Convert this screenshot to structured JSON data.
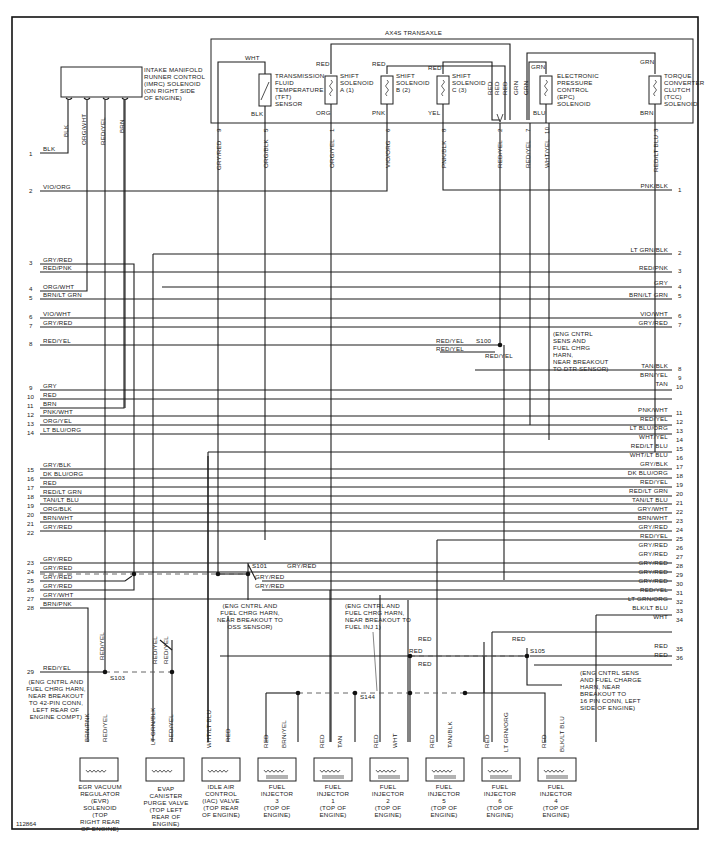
{
  "figure_id": "112864",
  "transaxle": {
    "title": "AX4S TRANSAXLE",
    "components": [
      {
        "id": "tft",
        "label": [
          "TRANSMISSION",
          "FLUID",
          "TEMPERATURE",
          "(TFT)",
          "SENSOR"
        ],
        "top_wire": "WHT",
        "bottom_wire": "BLK"
      },
      {
        "id": "ssa",
        "label": [
          "SHIFT",
          "SOLENOID",
          "A (1)"
        ],
        "top_wire": "RED",
        "bottom_wire": "ORG"
      },
      {
        "id": "ssb",
        "label": [
          "SHIFT",
          "SOLENOID",
          "B (2)"
        ],
        "top_wire": "RED",
        "bottom_wire": "PNK"
      },
      {
        "id": "ssc",
        "label": [
          "SHIFT",
          "SOLENOID",
          "C (3)"
        ],
        "top_wire": "RED",
        "bottom_wire": "YEL"
      },
      {
        "id": "epc",
        "label": [
          "ELECTRONIC",
          "PRESSURE",
          "CONTROL",
          "(EPC)",
          "SOLENOID"
        ],
        "top_wire": "GRN",
        "bottom_wire": "BLU"
      },
      {
        "id": "tcc",
        "label": [
          "TORQUE",
          "CONVERTER",
          "CLUTCH",
          "(TCC)",
          "SOLENOID"
        ],
        "top_wire": "GRN",
        "bottom_wire": "BRN"
      }
    ],
    "merge_labels": [
      "RED",
      "RED",
      "RED",
      "GRN",
      "GRN"
    ],
    "pins": [
      {
        "pin": "9",
        "wire": "GRY/RED"
      },
      {
        "pin": "5",
        "wire": "ORG/BLK"
      },
      {
        "pin": "1",
        "wire": "ORG/YEL"
      },
      {
        "pin": "6",
        "wire": "VIO/ORG"
      },
      {
        "pin": "8",
        "wire": "PNK/BLK"
      },
      {
        "pin": "2",
        "wire": "RED/YEL"
      },
      {
        "pin": "7",
        "wire": "RED/YEL"
      },
      {
        "pin": "10",
        "wire": "WHT/YEL"
      },
      {
        "pin": "3",
        "wire": "RED/LT BLU"
      }
    ]
  },
  "imrc": {
    "label": [
      "INTAKE MANIFOLD",
      "RUNNER CONTROL",
      "(IMRC) SOLENOID",
      "(ON RIGHT SIDE",
      "OF ENGINE)"
    ],
    "wires": [
      "BLK",
      "ORG/WHT",
      "RED/YEL",
      "BRN"
    ]
  },
  "left_connector": [
    {
      "pin": "1",
      "wire": "BLK"
    },
    {
      "pin": "2",
      "wire": "VIO/ORG"
    },
    {
      "pin": "3",
      "wire": "GRY/RED"
    },
    {
      "pin": "",
      "wire": "RED/PNK"
    },
    {
      "pin": "4",
      "wire": "ORG/WHT"
    },
    {
      "pin": "5",
      "wire": "BRN/LT GRN"
    },
    {
      "pin": "6",
      "wire": "VIO/WHT"
    },
    {
      "pin": "7",
      "wire": "GRY/RED"
    },
    {
      "pin": "8",
      "wire": "RED/YEL"
    },
    {
      "pin": "9",
      "wire": "GRY"
    },
    {
      "pin": "10",
      "wire": "RED"
    },
    {
      "pin": "11",
      "wire": "BRN"
    },
    {
      "pin": "12",
      "wire": "PNK/WHT"
    },
    {
      "pin": "13",
      "wire": "ORG/YEL"
    },
    {
      "pin": "14",
      "wire": "LT BLU/ORG"
    },
    {
      "pin": "15",
      "wire": "GRY/BLK"
    },
    {
      "pin": "16",
      "wire": "DK BLU/ORG"
    },
    {
      "pin": "17",
      "wire": "RED"
    },
    {
      "pin": "18",
      "wire": "RED/LT GRN"
    },
    {
      "pin": "19",
      "wire": "TAN/LT BLU"
    },
    {
      "pin": "20",
      "wire": "ORG/BLK"
    },
    {
      "pin": "21",
      "wire": "BRN/WHT"
    },
    {
      "pin": "22",
      "wire": "GRY/RED"
    },
    {
      "pin": "23",
      "wire": "GRY/RED"
    },
    {
      "pin": "24",
      "wire": "GRY/RED"
    },
    {
      "pin": "25",
      "wire": "GRY/RED"
    },
    {
      "pin": "26",
      "wire": "GRY/RED"
    },
    {
      "pin": "27",
      "wire": "GRY/WHT"
    },
    {
      "pin": "28",
      "wire": "BRN/PNK"
    },
    {
      "pin": "29",
      "wire": "RED/YEL"
    }
  ],
  "right_connector": [
    {
      "pin": "1",
      "wire": "PNK/BLK"
    },
    {
      "pin": "2",
      "wire": "LT GRN/BLK"
    },
    {
      "pin": "3",
      "wire": "RED/PNK"
    },
    {
      "pin": "4",
      "wire": "GRY"
    },
    {
      "pin": "5",
      "wire": "BRN/LT GRN"
    },
    {
      "pin": "6",
      "wire": "VIO/WHT"
    },
    {
      "pin": "7",
      "wire": "GRY/RED"
    },
    {
      "pin": "8",
      "wire": "TAN/BLK"
    },
    {
      "pin": "9",
      "wire": "BRN/YEL"
    },
    {
      "pin": "10",
      "wire": "TAN"
    },
    {
      "pin": "11",
      "wire": "PNK/WHT"
    },
    {
      "pin": "12",
      "wire": "RED/YEL"
    },
    {
      "pin": "13",
      "wire": "LT BLU/ORG"
    },
    {
      "pin": "14",
      "wire": "WHT/YEL"
    },
    {
      "pin": "15",
      "wire": "RED/LT BLU"
    },
    {
      "pin": "16",
      "wire": "WHT/LT BLU"
    },
    {
      "pin": "17",
      "wire": "GRY/BLK"
    },
    {
      "pin": "18",
      "wire": "DK BLU/ORG"
    },
    {
      "pin": "19",
      "wire": "RED/YEL"
    },
    {
      "pin": "20",
      "wire": "RED/LT GRN"
    },
    {
      "pin": "21",
      "wire": "TAN/LT BLU"
    },
    {
      "pin": "22",
      "wire": "GRY/WHT"
    },
    {
      "pin": "23",
      "wire": "BRN/WHT"
    },
    {
      "pin": "24",
      "wire": "GRY/RED"
    },
    {
      "pin": "25",
      "wire": "RED/YEL"
    },
    {
      "pin": "26",
      "wire": "GRY/RED"
    },
    {
      "pin": "27",
      "wire": "GRY/RED"
    },
    {
      "pin": "28",
      "wire": "GRY/RED"
    },
    {
      "pin": "29",
      "wire": "GRY/RED"
    },
    {
      "pin": "30",
      "wire": "GRY/RED"
    },
    {
      "pin": "31",
      "wire": "RED/YEL"
    },
    {
      "pin": "32",
      "wire": "LT GRN/ORG"
    },
    {
      "pin": "33",
      "wire": "BLK/LT BLU"
    },
    {
      "pin": "34",
      "wire": "WHT"
    },
    {
      "pin": "35",
      "wire": "RED"
    },
    {
      "pin": "36",
      "wire": "RED"
    }
  ],
  "splices": {
    "s100": {
      "id": "S100",
      "wires": [
        "RED/YEL",
        "RED/YEL",
        "RED/YEL"
      ],
      "note": [
        "(ENG CNTRL",
        "SENS AND",
        "FUEL CHRG",
        "HARN,",
        "NEAR BREAKOUT",
        "TO DTR SENSOR)"
      ]
    },
    "s101": {
      "id": "S101",
      "wires": [
        "GRY/RED",
        "GRY/RED",
        "GRY/RED"
      ],
      "note": [
        "(ENG CNTRL AND",
        "FUEL CHRG HARN,",
        "NEAR BREAKOUT TO",
        "OSS SENSOR)"
      ]
    },
    "s103": {
      "id": "S103",
      "wires": [
        "RED/YEL",
        "RED/YEL",
        "RED/YEL"
      ],
      "note": [
        "(ENG CNTRL AND",
        "FUEL CHRG HARN,",
        "NEAR BREAKOUT",
        "TO 42-PIN CONN,",
        "LEFT REAR OF",
        "ENGINE COMPT)"
      ]
    },
    "s144": {
      "id": "S144",
      "note": [
        "(ENG CNTRL AND",
        "FUEL CHRG HARN,",
        "NEAR BREAKOUT TO",
        "FUEL INJ 1)"
      ]
    },
    "s105": {
      "id": "S105",
      "wires": [
        "RED",
        "RED"
      ],
      "note": [
        "(ENG CNTRL SENS",
        "AND FUEL CHARGE",
        "HARN, NEAR",
        "BREAKOUT TO",
        "16 PIN CONN, LEFT",
        "SIDE OF ENGINE)"
      ]
    },
    "mid_red_labels": [
      "RED",
      "RED",
      "RED",
      "RED"
    ]
  },
  "bottom_components": [
    {
      "id": "evr",
      "wires": [
        "BRN/PNK",
        "RED/YEL"
      ],
      "label": [
        "EGR VACUUM",
        "REGULATOR",
        "(EVR)",
        "SOLENOID",
        "(TOP",
        "RIGHT REAR",
        "OF ENGINE)"
      ]
    },
    {
      "id": "evap",
      "wires": [
        "LT GRN/BLK",
        "RED/YEL"
      ],
      "label": [
        "EVAP",
        "CANISTER",
        "PURGE VALVE",
        "(TOP LEFT",
        "REAR OF",
        "ENGINE)"
      ]
    },
    {
      "id": "iac",
      "wires": [
        "WHT/LT BLU",
        "RED"
      ],
      "label": [
        "IDLE AIR",
        "CONTROL",
        "(IAC) VALVE",
        "(TOP REAR",
        "OF ENGINE)"
      ]
    },
    {
      "id": "inj3",
      "wires": [
        "RED",
        "BRN/YEL"
      ],
      "label": [
        "FUEL",
        "INJECTOR",
        "3",
        "(TOP OF",
        "ENGINE)"
      ]
    },
    {
      "id": "inj1",
      "wires": [
        "RED",
        "TAN"
      ],
      "label": [
        "FUEL",
        "INJECTOR",
        "1",
        "(TOP OF",
        "ENGINE)"
      ]
    },
    {
      "id": "inj2",
      "wires": [
        "RED",
        "WHT"
      ],
      "label": [
        "FUEL",
        "INJECTOR",
        "2",
        "(TOP OF",
        "ENGINE)"
      ]
    },
    {
      "id": "inj5",
      "wires": [
        "RED",
        "TAN/BLK"
      ],
      "label": [
        "FUEL",
        "INJECTOR",
        "5",
        "(TOP OF",
        "ENGINE)"
      ]
    },
    {
      "id": "inj6",
      "wires": [
        "RED",
        "LT GRN/ORG"
      ],
      "label": [
        "FUEL",
        "INJECTOR",
        "6",
        "(TOP OF",
        "ENGINE)"
      ]
    },
    {
      "id": "inj4",
      "wires": [
        "RED",
        "BLK/LT BLU"
      ],
      "label": [
        "FUEL",
        "INJECTOR",
        "4",
        "(TOP OF",
        "ENGINE)"
      ]
    }
  ]
}
